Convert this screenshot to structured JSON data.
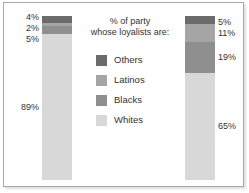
{
  "title": {
    "line1": "% of party",
    "line2": "whose loyalists are:"
  },
  "colors": {
    "others": "#6b6b6b",
    "latinos": "#a5a5a5",
    "blacks": "#8f8f8f",
    "whites": "#d8d8d8",
    "text": "#333333",
    "frame": "#a8a8a8",
    "background": "#ffffff"
  },
  "legend": {
    "items": [
      {
        "label": "Others",
        "color": "#6b6b6b"
      },
      {
        "label": "Latinos",
        "color": "#a5a5a5"
      },
      {
        "label": "Blacks",
        "color": "#8f8f8f"
      },
      {
        "label": "Whites",
        "color": "#d8d8d8"
      }
    ]
  },
  "bars": {
    "left": {
      "labels": {
        "others": "4%",
        "latinos": "2%",
        "blacks": "5%",
        "whites": "89%"
      }
    },
    "right": {
      "labels": {
        "others": "5%",
        "latinos": "11%",
        "blacks": "19%",
        "whites": "65%"
      }
    }
  },
  "chart_data": {
    "type": "bar",
    "subtype": "stacked-column-100",
    "title": "% of party whose loyalists are:",
    "xlabel": "",
    "ylabel": "",
    "ylim": [
      0,
      100
    ],
    "grid": false,
    "legend_position": "center",
    "categories": [
      "Party 1",
      "Party 2"
    ],
    "series": [
      {
        "name": "Others",
        "color": "#6b6b6b",
        "values": [
          4,
          5
        ],
        "labels": [
          "4%",
          "5%"
        ]
      },
      {
        "name": "Latinos",
        "color": "#a5a5a5",
        "values": [
          2,
          11
        ],
        "labels": [
          "2%",
          "11%"
        ]
      },
      {
        "name": "Blacks",
        "color": "#8f8f8f",
        "values": [
          5,
          19
        ],
        "labels": [
          "5%",
          "19%"
        ]
      },
      {
        "name": "Whites",
        "color": "#d8d8d8",
        "values": [
          89,
          65
        ],
        "labels": [
          "89%",
          "65%"
        ]
      }
    ],
    "stack_order_top_to_bottom": [
      "Others",
      "Latinos",
      "Blacks",
      "Whites"
    ]
  }
}
